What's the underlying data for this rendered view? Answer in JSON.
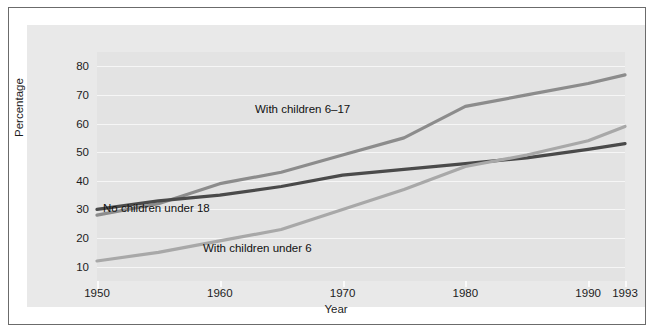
{
  "chart_data": {
    "type": "line",
    "title": "",
    "xlabel": "Year",
    "ylabel": "Percentage",
    "xlim": [
      1950,
      1993
    ],
    "ylim": [
      5,
      85
    ],
    "grid": true,
    "legend_position": "inline-annotations",
    "xticks": [
      1950,
      1960,
      1970,
      1980,
      1990,
      1993
    ],
    "xtick_labels": [
      "1950",
      "1960",
      "1970",
      "1980",
      "1990",
      "1993"
    ],
    "yticks": [
      10,
      20,
      30,
      40,
      50,
      60,
      70,
      80
    ],
    "ytick_labels": [
      "10",
      "20",
      "30",
      "40",
      "50",
      "60",
      "70",
      "80"
    ],
    "series": [
      {
        "name": "With children 6-17",
        "label": "With children 6–17",
        "color": "#8c8c8c",
        "x": [
          1950,
          1955,
          1960,
          1965,
          1970,
          1975,
          1980,
          1985,
          1990,
          1993
        ],
        "values": [
          28,
          32,
          39,
          43,
          49,
          55,
          66,
          70,
          74,
          77
        ]
      },
      {
        "name": "No children under 18",
        "label": "No children under 18",
        "color": "#4a4a4a",
        "x": [
          1950,
          1955,
          1960,
          1965,
          1970,
          1975,
          1980,
          1985,
          1990,
          1993
        ],
        "values": [
          30,
          33,
          35,
          38,
          42,
          44,
          46,
          48,
          51,
          53
        ]
      },
      {
        "name": "With children under 6",
        "label": "With children under 6",
        "color": "#a8a8a8",
        "x": [
          1950,
          1955,
          1960,
          1965,
          1970,
          1975,
          1980,
          1985,
          1990,
          1993
        ],
        "values": [
          12,
          15,
          19,
          23,
          30,
          37,
          45,
          49,
          54,
          59
        ]
      }
    ]
  },
  "axes": {
    "y_title": "Percentage",
    "x_title": "Year"
  },
  "annotations": {
    "with_children_6_17": "With children 6–17",
    "no_children_under_18": "No children under 18",
    "with_children_under_6": "With children under 6"
  }
}
